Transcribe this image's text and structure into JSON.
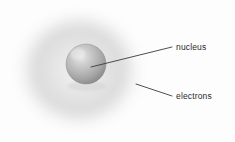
{
  "figure": {
    "background_color": "#fdfdfd"
  },
  "labels": {
    "nucleus": "nucleus",
    "electrons": "electrons"
  },
  "colors": {
    "label_text": "#2a2a2a",
    "leader_line": "#3b3b3b",
    "nucleus_highlight": "#e2e2e2",
    "nucleus_mid": "#bcbcbc",
    "nucleus_shadow": "#8e8e8e",
    "nucleus_edge": "#7d7d7d",
    "cloud_inner": "#efefef",
    "cloud_ring": "#dcdcdc",
    "cloud_outer": "#fdfdfd"
  },
  "elements": {
    "electron_cloud": {
      "name": "electron-cloud",
      "center_x": 79,
      "center_y": 70,
      "radius_x": 72,
      "radius_y": 68
    },
    "nucleus_sphere": {
      "name": "nucleus-sphere",
      "center_x": 86,
      "center_y": 64,
      "radius": 20,
      "highlight_x": 78,
      "highlight_y": 54
    },
    "leader_nucleus": {
      "name": "nucleus-leader-line",
      "x1": 91,
      "y1": 67,
      "x2": 172,
      "y2": 47
    },
    "leader_electrons": {
      "name": "electrons-leader-line",
      "x1": 136,
      "y1": 84,
      "x2": 172,
      "y2": 96
    }
  }
}
